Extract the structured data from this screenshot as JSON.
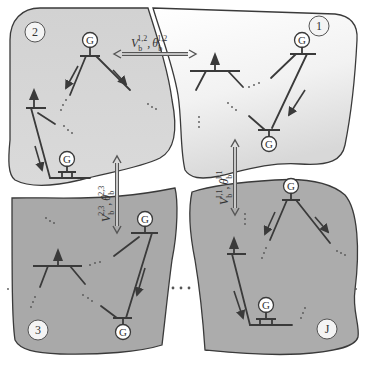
{
  "diagram": {
    "type": "multi-area power system decomposition",
    "colors": {
      "region_1_fill_top": "#ffffff",
      "region_1_fill_bottom": "#dcdcdc",
      "region_2_fill": "#d4d4d4",
      "region_3_fill": "#a9a9a9",
      "region_J_fill": "#acacac",
      "outline": "#3a3a3a",
      "background": "#ffffff"
    },
    "regions": [
      {
        "id": "1",
        "label": "1",
        "generators": [
          "G",
          "G"
        ],
        "has_load": true
      },
      {
        "id": "2",
        "label": "2",
        "generators": [
          "G",
          "G"
        ],
        "has_load": true
      },
      {
        "id": "3",
        "label": "3",
        "generators": [
          "G",
          "G"
        ],
        "has_load": true
      },
      {
        "id": "J",
        "label": "J",
        "generators": [
          "G",
          "G"
        ],
        "has_load": true
      }
    ],
    "generator_symbol": "G",
    "ellipsis": "...",
    "couplings": [
      {
        "between": [
          "1",
          "2"
        ],
        "direction": "horizontal",
        "var1": "V",
        "var1_sub": "b",
        "var1_sup": "1,2",
        "sep": ",",
        "var2": "θ",
        "var2_sub": "b",
        "var2_sup": "1,2"
      },
      {
        "between": [
          "2",
          "3"
        ],
        "direction": "vertical",
        "var1": "V",
        "var1_sub": "b",
        "var1_sup": "2,3",
        "sep": ",",
        "var2": "θ",
        "var2_sub": "b",
        "var2_sup": "2,3"
      },
      {
        "between": [
          "J",
          "1"
        ],
        "direction": "vertical",
        "var1": "V",
        "var1_sub": "b",
        "var1_sup": "J,1",
        "sep": ",",
        "var2": "θ",
        "var2_sub": "b",
        "var2_sup": "J,1"
      }
    ]
  }
}
